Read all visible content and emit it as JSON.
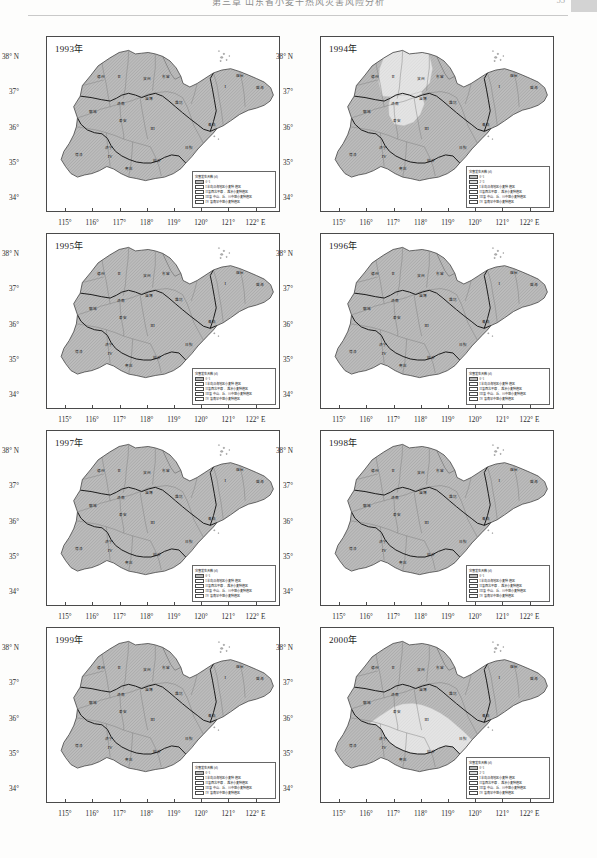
{
  "header": {
    "title": "第三章 山东省小麦干热风灾害风险分析",
    "page_number": "55"
  },
  "axes": {
    "x_ticks": [
      "115°",
      "116°",
      "117°",
      "118°",
      "119°",
      "120°",
      "121°",
      "122° E"
    ],
    "x_values": [
      115,
      116,
      117,
      118,
      119,
      120,
      121,
      122
    ],
    "y_ticks": [
      "38° N",
      "37°",
      "36°",
      "35°",
      "34°"
    ],
    "y_values": [
      38,
      37,
      36,
      35,
      34
    ],
    "xlim": [
      114.3,
      122.9
    ],
    "ylim": [
      33.6,
      38.6
    ]
  },
  "legend": {
    "title": "灾害发生天数 (d)",
    "classes": [
      {
        "label": "0~1",
        "swatch": "sw-a"
      },
      {
        "label": "2~3",
        "swatch": "sw-b"
      }
    ],
    "zones": [
      {
        "label": "I 半岛沿海地区小麦种植区",
        "swatch": "sw-w"
      },
      {
        "label": "II 鲁西北平原、滩涂小麦种植区",
        "swatch": "sw-w"
      },
      {
        "label": "III 鲁中山、丘、川中熟小麦种植区",
        "swatch": "sw-w"
      },
      {
        "label": "IV 鲁南早中熟小麦种植区",
        "swatch": "sw-w"
      }
    ]
  },
  "cities": [
    {
      "name": "德州",
      "x": 116.3,
      "y": 37.45
    },
    {
      "name": "聊城",
      "x": 115.98,
      "y": 36.45
    },
    {
      "name": "滨州",
      "x": 117.97,
      "y": 37.38
    },
    {
      "name": "东营",
      "x": 118.67,
      "y": 37.44
    },
    {
      "name": "烟台",
      "x": 121.4,
      "y": 37.47
    },
    {
      "name": "威海",
      "x": 122.12,
      "y": 37.13
    },
    {
      "name": "淄博",
      "x": 118.05,
      "y": 36.81
    },
    {
      "name": "潍坊",
      "x": 119.16,
      "y": 36.71
    },
    {
      "name": "济南",
      "x": 117.0,
      "y": 36.68
    },
    {
      "name": "泰安",
      "x": 117.09,
      "y": 36.2
    },
    {
      "name": "青岛",
      "x": 120.38,
      "y": 36.07
    },
    {
      "name": "日照",
      "x": 119.53,
      "y": 35.42
    },
    {
      "name": "济宁",
      "x": 116.59,
      "y": 35.42
    },
    {
      "name": "菏泽",
      "x": 115.48,
      "y": 35.23
    },
    {
      "name": "枣庄",
      "x": 117.32,
      "y": 34.81
    },
    {
      "name": "临沂",
      "x": 118.35,
      "y": 35.05
    }
  ],
  "zone_numerals": [
    {
      "label": "I",
      "x": 120.85,
      "y": 37.15
    },
    {
      "label": "II",
      "x": 116.95,
      "y": 37.45
    },
    {
      "label": "III",
      "x": 118.18,
      "y": 35.95
    },
    {
      "label": "IV",
      "x": 116.62,
      "y": 35.15
    }
  ],
  "panels": [
    {
      "id": "panel-1993",
      "year": "1993年",
      "legend_classes": 1,
      "shading": {
        "base": "sw-a",
        "light_zones": []
      }
    },
    {
      "id": "panel-1994",
      "year": "1994年",
      "legend_classes": 2,
      "shading": {
        "base": "sw-a",
        "light_zones": [
          "north-central",
          "central"
        ]
      }
    },
    {
      "id": "panel-1995",
      "year": "1995年",
      "legend_classes": 1,
      "shading": {
        "base": "sw-a",
        "light_zones": []
      }
    },
    {
      "id": "panel-1996",
      "year": "1996年",
      "legend_classes": 1,
      "shading": {
        "base": "sw-a",
        "light_zones": []
      }
    },
    {
      "id": "panel-1997",
      "year": "1997年",
      "legend_classes": 1,
      "shading": {
        "base": "sw-a",
        "light_zones": []
      }
    },
    {
      "id": "panel-1998",
      "year": "1998年",
      "legend_classes": 1,
      "shading": {
        "base": "sw-a",
        "light_zones": []
      }
    },
    {
      "id": "panel-1999",
      "year": "1999年",
      "legend_classes": 1,
      "shading": {
        "base": "sw-a",
        "light_zones": []
      }
    },
    {
      "id": "panel-2000",
      "year": "2000年",
      "legend_classes": 2,
      "shading": {
        "base": "sw-a",
        "light_zones": [
          "south-central"
        ]
      }
    }
  ],
  "chart_data": {
    "type": "map",
    "region": "山东省 (Shandong Province)",
    "xlabel": "经度 (° E)",
    "ylabel": "纬度 (° N)",
    "xlim": [
      114.3,
      122.9
    ],
    "ylim": [
      33.6,
      38.6
    ],
    "grid": false,
    "legend_position": "bottom-right inside plot",
    "unit": "d",
    "classes": [
      "0~1",
      "2~3"
    ],
    "panel_values": [
      {
        "year": 1993,
        "classes_present": [
          "0~1"
        ]
      },
      {
        "year": 1994,
        "classes_present": [
          "0~1",
          "2~3"
        ]
      },
      {
        "year": 1995,
        "classes_present": [
          "0~1"
        ]
      },
      {
        "year": 1996,
        "classes_present": [
          "0~1"
        ]
      },
      {
        "year": 1997,
        "classes_present": [
          "0~1"
        ]
      },
      {
        "year": 1998,
        "classes_present": [
          "0~1"
        ]
      },
      {
        "year": 1999,
        "classes_present": [
          "0~1"
        ]
      },
      {
        "year": 2000,
        "classes_present": [
          "0~1",
          "2~3"
        ]
      }
    ]
  }
}
